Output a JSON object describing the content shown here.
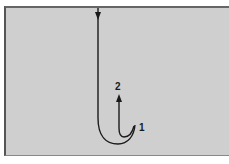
{
  "diagram": {
    "labels": {
      "step_1": "1",
      "step_2": "2"
    },
    "colors": {
      "background": "#cfcfcf",
      "stroke": "#1a1a1a",
      "page": "#ffffff"
    },
    "strokes": [
      {
        "id": "stroke-1",
        "direction": "down then curve up-right",
        "ends_at_label": "1"
      },
      {
        "id": "stroke-2",
        "direction": "curve from 1 then up",
        "ends_at_label": "2"
      }
    ]
  }
}
